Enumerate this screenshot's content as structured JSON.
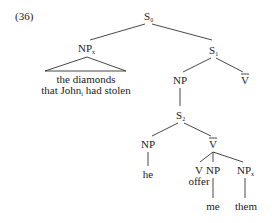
{
  "example_number": "(36)",
  "nodes": {
    "s0": {
      "label": "S",
      "sub": "0"
    },
    "np_x": {
      "label": "NP",
      "sub": "x"
    },
    "np_x_yield_line1": "the diamonds",
    "np_x_yield_line2_a": "that John",
    "np_x_yield_line2_sub": "i",
    "np_x_yield_line2_b": " had stolen",
    "s1": {
      "label": "S",
      "sub": "1"
    },
    "np_upper": {
      "label": "NP"
    },
    "vbar_upper": {
      "label": "V",
      "bar": true
    },
    "s2": {
      "label": "S",
      "sub": "2"
    },
    "np_he": {
      "label": "NP"
    },
    "he": "he",
    "vbar_lower": {
      "label": "V",
      "bar": true
    },
    "v": {
      "label": "V"
    },
    "offer": "offer",
    "np_me": {
      "label": "NP"
    },
    "me": "me",
    "np_them": {
      "label": "NP",
      "sub": "x"
    },
    "them": "them"
  }
}
